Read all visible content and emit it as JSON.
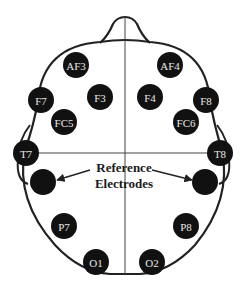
{
  "diagram": {
    "annotation": {
      "line1": "Reference",
      "line2": "Electrodes"
    },
    "electrodes": [
      {
        "id": "AF3",
        "label": "AF3"
      },
      {
        "id": "AF4",
        "label": "AF4"
      },
      {
        "id": "F7",
        "label": "F7"
      },
      {
        "id": "F3",
        "label": "F3"
      },
      {
        "id": "F4",
        "label": "F4"
      },
      {
        "id": "F8",
        "label": "F8"
      },
      {
        "id": "FC5",
        "label": "FC5"
      },
      {
        "id": "FC6",
        "label": "FC6"
      },
      {
        "id": "T7",
        "label": "T7"
      },
      {
        "id": "T8",
        "label": "T8"
      },
      {
        "id": "P7",
        "label": "P7"
      },
      {
        "id": "P8",
        "label": "P8"
      },
      {
        "id": "O1",
        "label": "O1"
      },
      {
        "id": "O2",
        "label": "O2"
      },
      {
        "id": "REF-L",
        "label": ""
      },
      {
        "id": "REF-R",
        "label": ""
      }
    ],
    "colors": {
      "electrode_fill": "#111111",
      "outline": "#222222",
      "label": "#e8e8e8"
    }
  }
}
